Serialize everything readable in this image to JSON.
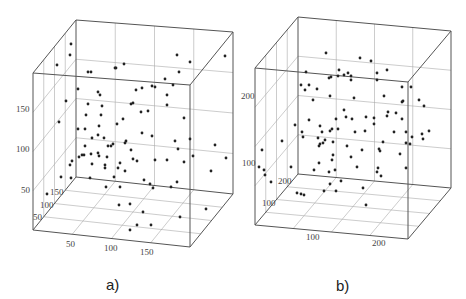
{
  "chart_data": [
    {
      "type": "scatter",
      "subtype": "3d-scatter",
      "caption": "a)",
      "x_ticks": [
        "50",
        "100",
        "150"
      ],
      "y_ticks": [
        "50",
        "100",
        "150"
      ],
      "z_ticks": [
        "50",
        "100",
        "150"
      ],
      "grid": true,
      "box": {
        "front": [
          [
            33,
            73
          ],
          [
            190,
            85
          ],
          [
            190,
            247
          ],
          [
            33,
            230
          ]
        ],
        "back_offset": [
          43,
          -53
        ]
      },
      "points_px": [
        [
          71,
          44
        ],
        [
          70,
          55
        ],
        [
          57,
          65
        ],
        [
          88,
          72
        ],
        [
          91,
          72
        ],
        [
          116,
          68
        ],
        [
          115,
          68
        ],
        [
          124,
          64
        ],
        [
          177,
          55
        ],
        [
          190,
          62
        ],
        [
          225,
          56
        ],
        [
          179,
          72
        ],
        [
          165,
          79
        ],
        [
          173,
          85
        ],
        [
          78,
          89
        ],
        [
          98,
          92
        ],
        [
          100,
          95
        ],
        [
          136,
          90
        ],
        [
          142,
          88
        ],
        [
          152,
          86
        ],
        [
          155,
          87
        ],
        [
          167,
          95
        ],
        [
          167,
          105
        ],
        [
          66,
          101
        ],
        [
          88,
          104
        ],
        [
          102,
          106
        ],
        [
          131,
          104
        ],
        [
          133,
          103
        ],
        [
          141,
          112
        ],
        [
          148,
          111
        ],
        [
          86,
          115
        ],
        [
          101,
          115
        ],
        [
          184,
          118
        ],
        [
          59,
          122
        ],
        [
          123,
          119
        ],
        [
          117,
          124
        ],
        [
          78,
          129
        ],
        [
          85,
          129
        ],
        [
          99,
          126
        ],
        [
          98,
          135
        ],
        [
          92,
          138
        ],
        [
          104,
          138
        ],
        [
          142,
          133
        ],
        [
          152,
          136
        ],
        [
          126,
          141
        ],
        [
          190,
          139
        ],
        [
          215,
          145
        ],
        [
          85,
          146
        ],
        [
          108,
          146
        ],
        [
          111,
          146
        ],
        [
          113,
          144
        ],
        [
          125,
          143
        ],
        [
          175,
          141
        ],
        [
          178,
          149
        ],
        [
          82,
          155
        ],
        [
          84,
          155
        ],
        [
          79,
          157
        ],
        [
          70,
          165
        ],
        [
          72,
          161
        ],
        [
          91,
          154
        ],
        [
          98,
          153
        ],
        [
          99,
          156
        ],
        [
          107,
          157
        ],
        [
          131,
          150
        ],
        [
          133,
          159
        ],
        [
          137,
          161
        ],
        [
          92,
          164
        ],
        [
          105,
          165
        ],
        [
          105,
          168
        ],
        [
          120,
          163
        ],
        [
          118,
          168
        ],
        [
          125,
          171
        ],
        [
          155,
          160
        ],
        [
          167,
          160
        ],
        [
          184,
          162
        ],
        [
          193,
          156
        ],
        [
          226,
          158
        ],
        [
          71,
          178
        ],
        [
          90,
          178
        ],
        [
          114,
          177
        ],
        [
          144,
          180
        ],
        [
          150,
          184
        ],
        [
          153,
          188
        ],
        [
          177,
          182
        ],
        [
          171,
          187
        ],
        [
          211,
          171
        ],
        [
          61,
          177
        ],
        [
          106,
          187
        ],
        [
          120,
          187
        ],
        [
          47,
          194
        ],
        [
          119,
          205
        ],
        [
          130,
          204
        ],
        [
          143,
          212
        ],
        [
          206,
          209
        ],
        [
          180,
          217
        ],
        [
          137,
          225
        ],
        [
          151,
          225
        ],
        [
          130,
          230
        ]
      ],
      "tick_labels_px": {
        "z": [
          {
            "t": "150",
            "x": 16,
            "y": 112
          },
          {
            "t": "100",
            "x": 16,
            "y": 152
          },
          {
            "t": "50",
            "x": 21,
            "y": 193
          }
        ],
        "y": [
          {
            "t": "150",
            "x": 50,
            "y": 195
          },
          {
            "t": "100",
            "x": 40,
            "y": 208
          },
          {
            "t": "50",
            "x": 33,
            "y": 220
          }
        ],
        "x": [
          {
            "t": "50",
            "x": 66,
            "y": 247
          },
          {
            "t": "100",
            "x": 104,
            "y": 251
          },
          {
            "t": "150",
            "x": 140,
            "y": 255
          }
        ]
      }
    },
    {
      "type": "scatter",
      "subtype": "3d-scatter",
      "caption": "b)",
      "x_ticks": [
        "100",
        "200"
      ],
      "y_ticks": [
        "100",
        "200"
      ],
      "z_ticks": [
        "100",
        "200"
      ],
      "grid": true,
      "box": {
        "front": [
          [
            255,
            68
          ],
          [
            408,
            82
          ],
          [
            408,
            239
          ],
          [
            255,
            225
          ]
        ],
        "back_offset": [
          43,
          -51
        ]
      },
      "points_px": [
        [
          326,
          53
        ],
        [
          360,
          58
        ],
        [
          371,
          61
        ],
        [
          306,
          72
        ],
        [
          339,
          70
        ],
        [
          348,
          73
        ],
        [
          344,
          75
        ],
        [
          338,
          76
        ],
        [
          351,
          76
        ],
        [
          377,
          73
        ],
        [
          387,
          70
        ],
        [
          329,
          78
        ],
        [
          331,
          77
        ],
        [
          351,
          80
        ],
        [
          377,
          80
        ],
        [
          301,
          85
        ],
        [
          309,
          85
        ],
        [
          305,
          90
        ],
        [
          317,
          89
        ],
        [
          402,
          87
        ],
        [
          411,
          87
        ],
        [
          330,
          96
        ],
        [
          354,
          98
        ],
        [
          313,
          100
        ],
        [
          384,
          96
        ],
        [
          403,
          101
        ],
        [
          419,
          100
        ],
        [
          424,
          106
        ],
        [
          344,
          110
        ],
        [
          402,
          102
        ],
        [
          388,
          112
        ],
        [
          396,
          113
        ],
        [
          366,
          117
        ],
        [
          387,
          116
        ],
        [
          374,
          118
        ],
        [
          346,
          117
        ],
        [
          336,
          119
        ],
        [
          352,
          119
        ],
        [
          295,
          125
        ],
        [
          309,
          120
        ],
        [
          320,
          126
        ],
        [
          332,
          129
        ],
        [
          338,
          129
        ],
        [
          330,
          131
        ],
        [
          374,
          124
        ],
        [
          402,
          119
        ],
        [
          322,
          132
        ],
        [
          318,
          138
        ],
        [
          355,
          132
        ],
        [
          282,
          141
        ],
        [
          262,
          150
        ],
        [
          302,
          132
        ],
        [
          303,
          137
        ],
        [
          320,
          144
        ],
        [
          323,
          143
        ],
        [
          325,
          140
        ],
        [
          333,
          142
        ],
        [
          365,
          131
        ],
        [
          394,
          132
        ],
        [
          383,
          142
        ],
        [
          406,
          132
        ],
        [
          412,
          137
        ],
        [
          422,
          134
        ],
        [
          429,
          131
        ],
        [
          423,
          139
        ],
        [
          406,
          143
        ],
        [
          410,
          144
        ],
        [
          319,
          146
        ],
        [
          333,
          155
        ],
        [
          351,
          157
        ],
        [
          332,
          160
        ],
        [
          362,
          150
        ],
        [
          347,
          146
        ],
        [
          379,
          149
        ],
        [
          380,
          151
        ],
        [
          259,
          167
        ],
        [
          291,
          167
        ],
        [
          319,
          163
        ],
        [
          329,
          172
        ],
        [
          357,
          167
        ],
        [
          400,
          154
        ],
        [
          378,
          168
        ],
        [
          377,
          172
        ],
        [
          381,
          176
        ],
        [
          264,
          170
        ],
        [
          265,
          175
        ],
        [
          314,
          170
        ],
        [
          335,
          170
        ],
        [
          271,
          182
        ],
        [
          341,
          181
        ],
        [
          330,
          184
        ],
        [
          363,
          188
        ],
        [
          406,
          168
        ],
        [
          324,
          191
        ],
        [
          336,
          191
        ],
        [
          301,
          194
        ],
        [
          297,
          193
        ],
        [
          304,
          195
        ],
        [
          366,
          205
        ]
      ],
      "tick_labels_px": {
        "z": [
          {
            "t": "200",
            "x": 241,
            "y": 99
          },
          {
            "t": "100",
            "x": 242,
            "y": 166
          }
        ],
        "y": [
          {
            "t": "200",
            "x": 278,
            "y": 184
          },
          {
            "t": "100",
            "x": 262,
            "y": 206
          }
        ],
        "x": [
          {
            "t": "100",
            "x": 306,
            "y": 240
          },
          {
            "t": "200",
            "x": 372,
            "y": 246
          }
        ]
      }
    }
  ],
  "captions": {
    "a": "a)",
    "b": "b)"
  }
}
